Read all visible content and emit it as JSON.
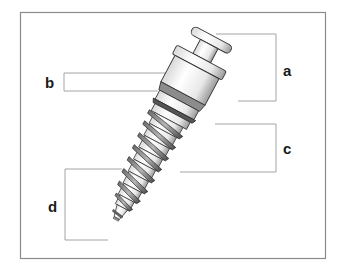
{
  "diagram": {
    "frame_color": "#8a8a8a",
    "bracket_color": "#9a9a9a",
    "label_color": "#1a1a1a",
    "labels": [
      {
        "id": "a",
        "text": "a",
        "x": 283,
        "y": 63
      },
      {
        "id": "b",
        "text": "b",
        "x": 45,
        "y": 75
      },
      {
        "id": "c",
        "text": "c",
        "x": 283,
        "y": 141
      },
      {
        "id": "d",
        "text": "d",
        "x": 48,
        "y": 199
      }
    ]
  }
}
